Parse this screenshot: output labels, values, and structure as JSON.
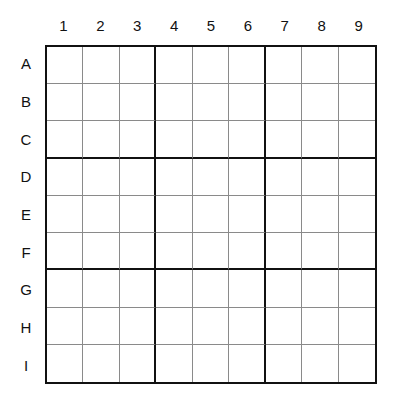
{
  "puzzle": {
    "type": "sudoku",
    "size": 9,
    "column_labels": [
      "1",
      "2",
      "3",
      "4",
      "5",
      "6",
      "7",
      "8",
      "9"
    ],
    "row_labels": [
      "A",
      "B",
      "C",
      "D",
      "E",
      "F",
      "G",
      "H",
      "I"
    ],
    "cells": [
      [
        "",
        "",
        "",
        "",
        "",
        "",
        "",
        "",
        ""
      ],
      [
        "",
        "",
        "",
        "",
        "",
        "",
        "",
        "",
        ""
      ],
      [
        "",
        "",
        "",
        "",
        "",
        "",
        "",
        "",
        ""
      ],
      [
        "",
        "",
        "",
        "",
        "",
        "",
        "",
        "",
        ""
      ],
      [
        "",
        "",
        "",
        "",
        "",
        "",
        "",
        "",
        ""
      ],
      [
        "",
        "",
        "",
        "",
        "",
        "",
        "",
        "",
        ""
      ],
      [
        "",
        "",
        "",
        "",
        "",
        "",
        "",
        "",
        ""
      ],
      [
        "",
        "",
        "",
        "",
        "",
        "",
        "",
        "",
        ""
      ],
      [
        "",
        "",
        "",
        "",
        "",
        "",
        "",
        "",
        ""
      ]
    ]
  }
}
